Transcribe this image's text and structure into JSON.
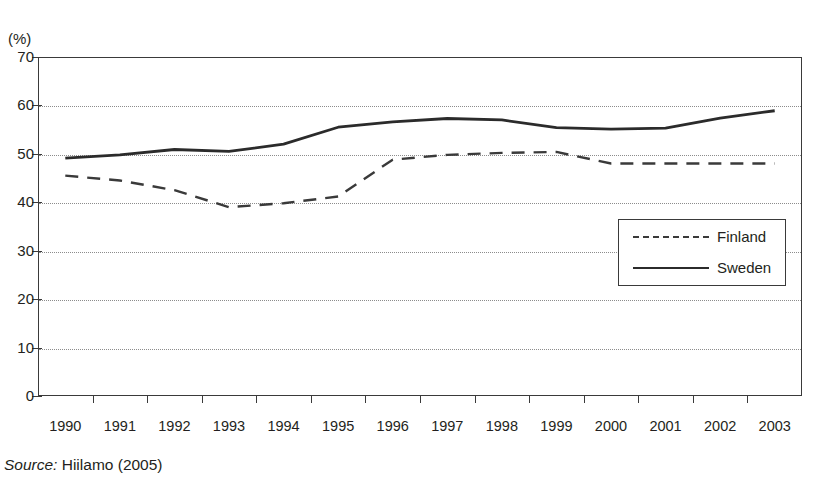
{
  "figure": {
    "unit_label": "(%)",
    "title_cut_off": "",
    "source_prefix": "Source:",
    "source_text": "Hiilamo (2005)"
  },
  "chart_data": {
    "type": "line",
    "title": "",
    "xlabel": "",
    "ylabel": "(%)",
    "categories": [
      "1990",
      "1991",
      "1992",
      "1993",
      "1994",
      "1995",
      "1996",
      "1997",
      "1998",
      "1999",
      "2000",
      "2001",
      "2002",
      "2003"
    ],
    "yticks": [
      0,
      10,
      20,
      30,
      40,
      50,
      60,
      70
    ],
    "ytick_labels": [
      "0",
      "10",
      "20",
      "30",
      "40",
      "50",
      "60",
      "70"
    ],
    "ylim": [
      0,
      70
    ],
    "grid": "horizontal-dotted",
    "legend_position": "center-right inside plot",
    "series": [
      {
        "name": "Finland",
        "style": "dashed",
        "color": "#3a3a3a",
        "values": [
          45.5,
          44.5,
          42.5,
          39.0,
          39.8,
          41.2,
          48.8,
          49.8,
          50.2,
          50.4,
          48.0,
          48.0,
          48.0,
          48.0
        ]
      },
      {
        "name": "Sweden",
        "style": "solid",
        "color": "#2b2b2b",
        "values": [
          49.1,
          49.8,
          50.9,
          50.5,
          52.0,
          55.5,
          56.6,
          57.3,
          57.0,
          55.4,
          55.1,
          55.3,
          57.4,
          58.9
        ]
      }
    ]
  },
  "legend": {
    "items": [
      {
        "label": "Finland",
        "style": "dashed"
      },
      {
        "label": "Sweden",
        "style": "solid"
      }
    ]
  }
}
